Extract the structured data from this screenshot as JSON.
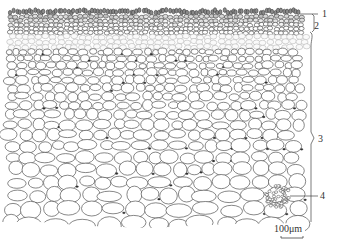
{
  "figure": {
    "labels": [
      {
        "id": "1",
        "text": "1"
      },
      {
        "id": "2",
        "text": "2"
      },
      {
        "id": "3",
        "text": "3"
      },
      {
        "id": "4",
        "text": "4"
      }
    ],
    "scale_bar": {
      "text": "100μm"
    },
    "colors": {
      "cell_wall": "#555555",
      "dense": "#3a3a3a",
      "background": "#ffffff"
    }
  }
}
